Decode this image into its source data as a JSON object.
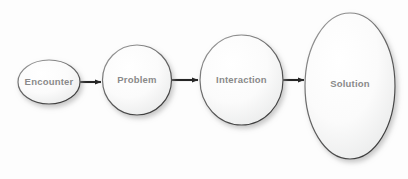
{
  "diagram": {
    "type": "flow-process",
    "title": "",
    "background_color": "#fdfdfd",
    "node_fill_light": "#fefefe",
    "node_fill_dark": "#eceded",
    "node_stroke_color": "#5e5e5e",
    "label_color": "#8a8a8a",
    "arrow_color": "#262626",
    "nodes": [
      {
        "id": "encounter",
        "label": "Encounter",
        "cx": 49,
        "cy": 82,
        "rx": 31,
        "ry": 22
      },
      {
        "id": "problem",
        "label": "Problem",
        "cx": 137,
        "cy": 80,
        "rx": 34.5,
        "ry": 35
      },
      {
        "id": "interaction",
        "label": "Interaction",
        "cx": 241.5,
        "cy": 80,
        "rx": 41.5,
        "ry": 45
      },
      {
        "id": "solution",
        "label": "Solution",
        "cx": 350,
        "cy": 86,
        "rx": 45,
        "ry": 73
      }
    ],
    "connectors": [
      {
        "id": "encounter-to-problem",
        "from": "encounter",
        "to": "problem",
        "x1": 80,
        "x2": 103,
        "y": 82
      },
      {
        "id": "problem-to-interaction",
        "from": "problem",
        "to": "interaction",
        "x1": 172,
        "x2": 200,
        "y": 80
      },
      {
        "id": "interaction-to-solution",
        "from": "interaction",
        "to": "solution",
        "x1": 283,
        "x2": 306,
        "y": 80
      }
    ]
  }
}
